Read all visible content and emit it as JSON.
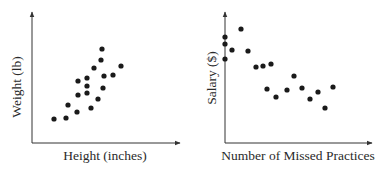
{
  "chart_data": [
    {
      "type": "scatter",
      "title": "",
      "xlabel": "Height (inches)",
      "ylabel": "Weight (lb)",
      "grid": false,
      "legend": null,
      "axis_ticks": "none",
      "trend": "positive",
      "points": [
        [
          54,
          119
        ],
        [
          66,
          118
        ],
        [
          68,
          105
        ],
        [
          77,
          112
        ],
        [
          78,
          95
        ],
        [
          78,
          81
        ],
        [
          87,
          78
        ],
        [
          87,
          86
        ],
        [
          87,
          93
        ],
        [
          91,
          108
        ],
        [
          94,
          68
        ],
        [
          98,
          99
        ],
        [
          101,
          60
        ],
        [
          102,
          49
        ],
        [
          103,
          88
        ],
        [
          104,
          76
        ],
        [
          113,
          75
        ],
        [
          121,
          66
        ]
      ],
      "points_note": "pixel coordinates within a 381x173 canvas; axes unlabeled numerically",
      "axes": {
        "origin": [
          32,
          143
        ],
        "x_end": 180,
        "y_top": 12
      }
    },
    {
      "type": "scatter",
      "title": "",
      "xlabel": "Number of Missed Practices",
      "ylabel": "Salary ($)",
      "grid": false,
      "legend": null,
      "axis_ticks": "none",
      "trend": "negative",
      "points": [
        [
          225,
          37
        ],
        [
          225,
          44
        ],
        [
          225,
          59
        ],
        [
          232,
          50
        ],
        [
          241,
          29
        ],
        [
          248,
          51
        ],
        [
          256,
          67
        ],
        [
          263,
          66
        ],
        [
          271,
          64
        ],
        [
          267,
          89
        ],
        [
          276,
          97
        ],
        [
          287,
          90
        ],
        [
          294,
          76
        ],
        [
          302,
          88
        ],
        [
          310,
          99
        ],
        [
          318,
          92
        ],
        [
          325,
          108
        ],
        [
          333,
          87
        ]
      ],
      "points_note": "pixel coordinates within a 381x173 canvas; axes unlabeled numerically",
      "axes": {
        "origin": [
          225,
          143
        ],
        "x_end": 372,
        "y_top": 12
      }
    }
  ],
  "colors": {
    "ink": "#1a1a1a",
    "axis": "#333333",
    "background": "#ffffff"
  }
}
